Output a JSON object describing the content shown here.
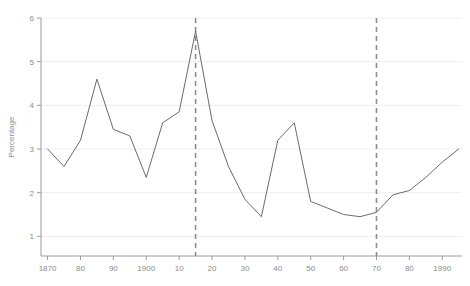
{
  "chart_data": {
    "type": "line",
    "title": "",
    "subtitle": "",
    "xlabel": "",
    "ylabel": "Percentage",
    "xlim": [
      1868,
      1996
    ],
    "ylim": [
      0.55,
      6
    ],
    "grid": true,
    "legend": "none",
    "line_color": "#6b6b6b",
    "grid_color": "#eeeeee",
    "axis_color": "#9a9a9a",
    "marker_color": "#8c8c8c",
    "x_tick_values": [
      1870,
      1880,
      1890,
      1900,
      1910,
      1920,
      1930,
      1940,
      1950,
      1960,
      1970,
      1980,
      1990
    ],
    "x_tick_labels": [
      "1870",
      "80",
      "90",
      "1900",
      "10",
      "20",
      "30",
      "40",
      "50",
      "60",
      "70",
      "80",
      "1990"
    ],
    "y_tick_values": [
      1,
      2,
      3,
      4,
      5,
      6
    ],
    "y_tick_labels": [
      "1",
      "2",
      "3",
      "4",
      "5",
      "6"
    ],
    "annotations": [
      {
        "name": "marker-1915",
        "type": "vline",
        "x": 1915,
        "style": "dashed"
      },
      {
        "name": "marker-1970",
        "type": "vline",
        "x": 1970,
        "style": "dashed"
      }
    ],
    "series": [
      {
        "name": "percentage",
        "x": [
          1870,
          1875,
          1880,
          1885,
          1890,
          1895,
          1900,
          1905,
          1910,
          1915,
          1920,
          1925,
          1930,
          1935,
          1940,
          1945,
          1950,
          1955,
          1960,
          1965,
          1970,
          1975,
          1980,
          1985,
          1990,
          1995
        ],
        "values": [
          3.0,
          2.6,
          3.2,
          4.6,
          3.45,
          3.3,
          2.35,
          3.6,
          3.85,
          5.7,
          3.65,
          2.6,
          1.85,
          1.45,
          3.2,
          3.6,
          1.8,
          1.65,
          1.5,
          1.45,
          1.55,
          1.95,
          2.05,
          2.35,
          2.7,
          3.0
        ]
      }
    ]
  }
}
